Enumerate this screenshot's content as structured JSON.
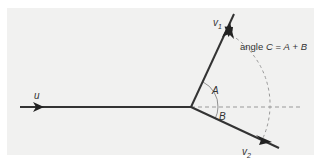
{
  "diagram": {
    "colors": {
      "background": "#f1f1f0",
      "vector": "#333333",
      "dashed": "#999999"
    },
    "labels": {
      "u": "u",
      "v1_base": "v",
      "v1_sub": "1",
      "v2_base": "v",
      "v2_sub": "2",
      "angle_a": "A",
      "angle_b": "B",
      "angle_c_prefix": "angle ",
      "angle_c_var": "C",
      "angle_c_eq": " = ",
      "angle_c_a": "A",
      "angle_c_plus": " + ",
      "angle_c_b": "B"
    }
  }
}
